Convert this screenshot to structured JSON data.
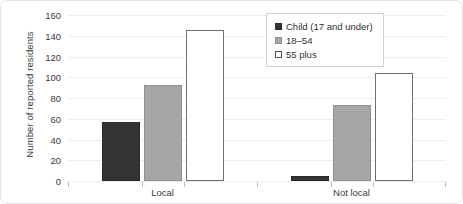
{
  "chart_data": {
    "type": "bar",
    "title": "",
    "xlabel": "",
    "ylabel": "Number of reported residents",
    "categories": [
      "Local",
      "Not local"
    ],
    "series": [
      {
        "name": "Child (17 and under)",
        "values": [
          57,
          5
        ],
        "color": "#333333",
        "swatch": "child"
      },
      {
        "name": "18–54",
        "values": [
          93,
          73
        ],
        "color": "#A6A6A6",
        "swatch": "mid"
      },
      {
        "name": "55 plus",
        "values": [
          146,
          104
        ],
        "color": "#FFFFFF",
        "swatch": "senior"
      }
    ],
    "ylim": [
      0,
      160
    ],
    "yticks": [
      0,
      20,
      40,
      60,
      80,
      100,
      120,
      140,
      160
    ],
    "ytick_labels": [
      "0",
      "20",
      "40",
      "60",
      "80",
      "100",
      "120",
      "140",
      "160"
    ],
    "grid": true,
    "legend_position": "top-right"
  }
}
